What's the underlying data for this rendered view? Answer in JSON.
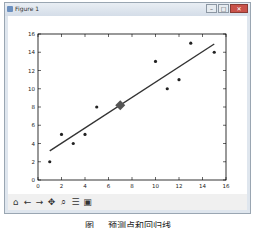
{
  "window": {
    "title": "Figure 1",
    "buttons": {
      "minimize": "–",
      "maximize": "□",
      "close": "✕"
    }
  },
  "toolbar": {
    "items": [
      {
        "name": "home-icon",
        "glyph": "⌂"
      },
      {
        "name": "back-icon",
        "glyph": "←"
      },
      {
        "name": "forward-icon",
        "glyph": "→"
      },
      {
        "name": "pan-icon",
        "glyph": "✥"
      },
      {
        "name": "zoom-icon",
        "glyph": "⌕"
      },
      {
        "name": "subplots-icon",
        "glyph": "☰"
      },
      {
        "name": "save-icon",
        "glyph": "▣"
      }
    ]
  },
  "caption": "图 … 预测点和回归线",
  "chart_data": {
    "type": "scatter",
    "title": "",
    "xlabel": "",
    "ylabel": "",
    "xlim": [
      0,
      16
    ],
    "ylim": [
      0,
      16
    ],
    "xticks": [
      0,
      2,
      4,
      6,
      8,
      10,
      12,
      14,
      16
    ],
    "yticks": [
      0,
      2,
      4,
      6,
      8,
      10,
      12,
      14,
      16
    ],
    "grid": false,
    "series": [
      {
        "name": "data points",
        "marker": "circle",
        "x": [
          1,
          2,
          3,
          4,
          5,
          10,
          11,
          12,
          13,
          15
        ],
        "y": [
          2,
          5,
          4,
          5,
          8,
          13,
          10,
          11,
          15,
          14
        ]
      },
      {
        "name": "regression line",
        "type": "line",
        "x": [
          1,
          15
        ],
        "y": [
          3.2,
          14.9
        ]
      },
      {
        "name": "predicted point",
        "marker": "diamond",
        "x": [
          7
        ],
        "y": [
          8.2
        ],
        "color": "#555555"
      }
    ],
    "colors": {
      "points": "#222222",
      "line": "#333333",
      "diamond": "#555555"
    }
  }
}
